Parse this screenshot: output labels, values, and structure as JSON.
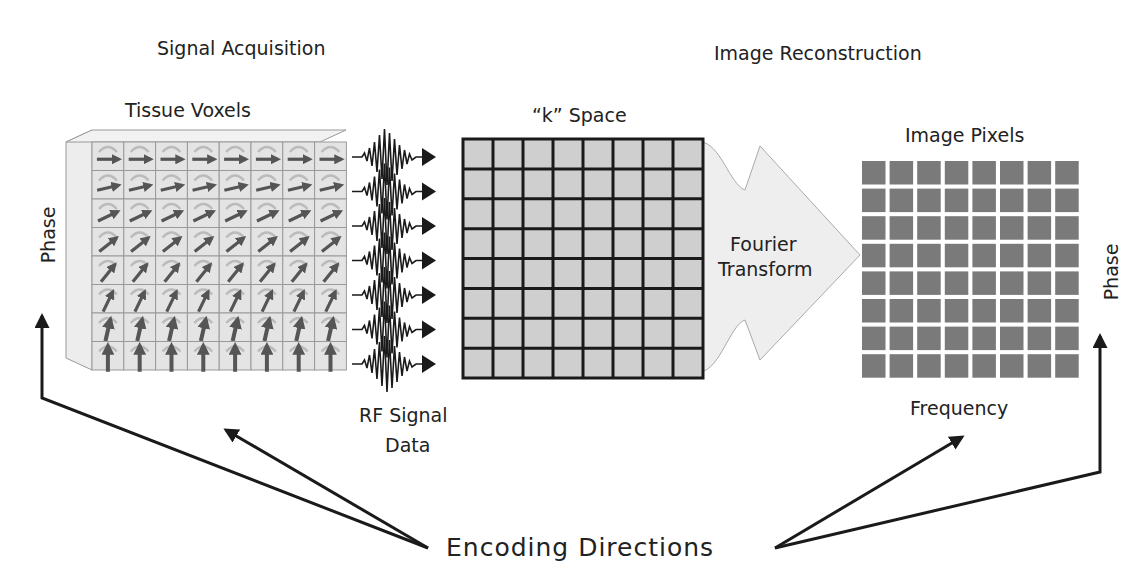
{
  "sections": {
    "left_title": "Signal Acquisition",
    "right_title": "Image Reconstruction"
  },
  "panels": {
    "tissue_voxels": {
      "title": "Tissue Voxels",
      "axis_label": "Phase",
      "rows": 8,
      "cols": 8
    },
    "rf_signal": {
      "label_line1": "RF Signal",
      "label_line2": "Data",
      "lines": 7
    },
    "k_space": {
      "title": "“k” Space",
      "rows": 8,
      "cols": 8
    },
    "fourier": {
      "label_line1": "Fourier",
      "label_line2": "Transform"
    },
    "image_pixels": {
      "title": "Image Pixels",
      "axis_phase": "Phase",
      "axis_frequency": "Frequency",
      "rows": 8,
      "cols": 8
    }
  },
  "footer": {
    "encoding_label": "Encoding Directions"
  },
  "colors": {
    "line": "#1a1a1a",
    "voxel_face": "#e4e4e4",
    "voxel_arrow": "#555555",
    "kspace_cell": "#cfcfcf",
    "pixel_cell": "#7a7a7a",
    "fourier_arrow": "#eeeeee"
  }
}
